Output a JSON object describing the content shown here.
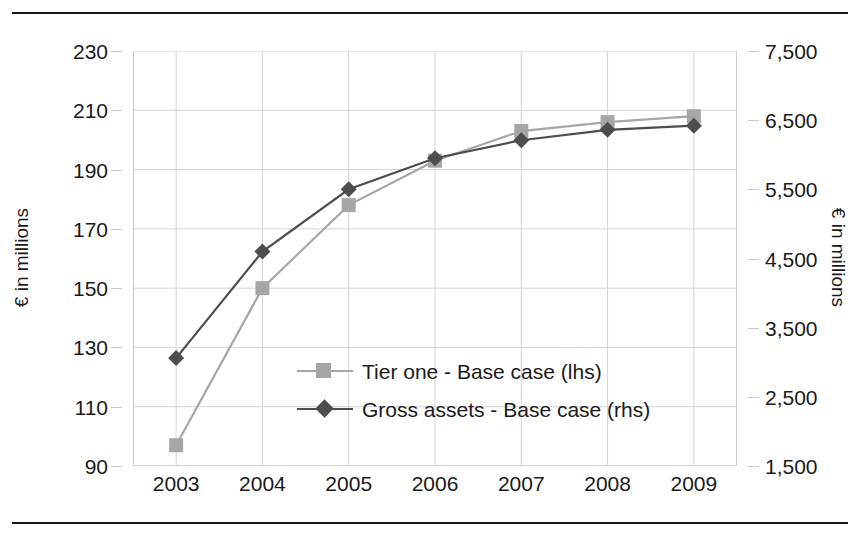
{
  "chart_data": {
    "type": "line",
    "title": "",
    "xlabel": "",
    "ylabel": "€ in millions",
    "y2label": "€ in millions",
    "categories": [
      "2003",
      "2004",
      "2005",
      "2006",
      "2007",
      "2008",
      "2009"
    ],
    "x": [
      2003,
      2004,
      2005,
      2006,
      2007,
      2008,
      2009
    ],
    "ylim": [
      90,
      230
    ],
    "y2lim": [
      1500,
      7500
    ],
    "yticks": [
      90,
      110,
      130,
      150,
      170,
      190,
      210,
      230
    ],
    "ytick_labels": [
      "90",
      "110",
      "130",
      "150",
      "170",
      "190",
      "210",
      "230"
    ],
    "y2ticks": [
      1500,
      2500,
      3500,
      4500,
      5500,
      6500,
      7500
    ],
    "y2tick_labels": [
      "1,500",
      "2,500",
      "3,500",
      "4,500",
      "5,500",
      "6,500",
      "7,500"
    ],
    "grid": true,
    "legend_position": "center",
    "series": [
      {
        "name": "Tier one - Base case (lhs)",
        "axis": "left",
        "color": "#a6a6a6",
        "marker": "square",
        "values": [
          97,
          150,
          178,
          193,
          203,
          206,
          208
        ]
      },
      {
        "name": "Gross assets - Base case (rhs)",
        "axis": "right",
        "color": "#4d4d4d",
        "marker": "diamond",
        "values": [
          3060,
          4600,
          5500,
          5950,
          6210,
          6360,
          6420
        ]
      }
    ]
  },
  "axes": {
    "left_title": "€ in millions",
    "right_title": "€ in millions"
  },
  "legend": {
    "items": [
      {
        "label": "Tier one - Base case (lhs)"
      },
      {
        "label": "Gross assets - Base case (rhs)"
      }
    ]
  },
  "colors": {
    "series_light": "#a6a6a6",
    "series_dark": "#4d4d4d",
    "grid": "#d4d4d4",
    "axis": "#c8c8c8",
    "rule": "#141414",
    "text": "#1a1a1a",
    "background": "#ffffff"
  }
}
